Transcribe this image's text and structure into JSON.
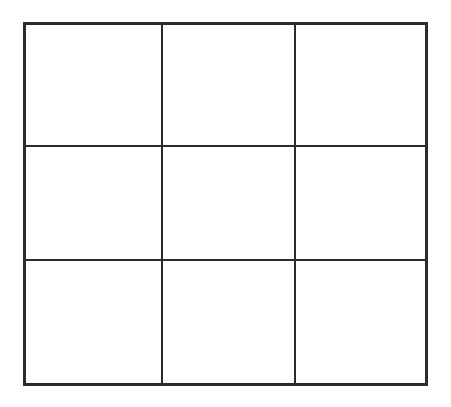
{
  "figure": {
    "kind": "empty-3x3-grid",
    "title": "",
    "caption": "",
    "background_color": "#ffffff",
    "line_color": "#2b2b2b",
    "outer_border_width_px": 3.5,
    "inner_line_width_px": 2.2,
    "bounds_px": {
      "left": 23,
      "top": 22,
      "width": 405,
      "height": 364
    },
    "rows": 3,
    "columns": 3,
    "vertical_divider_x_px": [
      161,
      294
    ],
    "horizontal_divider_y_px": [
      145,
      259
    ]
  },
  "grid": {
    "row_labels": [
      "",
      "",
      ""
    ],
    "column_labels": [
      "",
      "",
      ""
    ],
    "cells": [
      [
        {
          "name": "cell-r1c1",
          "text": ""
        },
        {
          "name": "cell-r1c2",
          "text": ""
        },
        {
          "name": "cell-r1c3",
          "text": ""
        }
      ],
      [
        {
          "name": "cell-r2c1",
          "text": ""
        },
        {
          "name": "cell-r2c2",
          "text": ""
        },
        {
          "name": "cell-r2c3",
          "text": ""
        }
      ],
      [
        {
          "name": "cell-r3c1",
          "text": ""
        },
        {
          "name": "cell-r3c2",
          "text": ""
        },
        {
          "name": "cell-r3c3",
          "text": ""
        }
      ]
    ]
  }
}
